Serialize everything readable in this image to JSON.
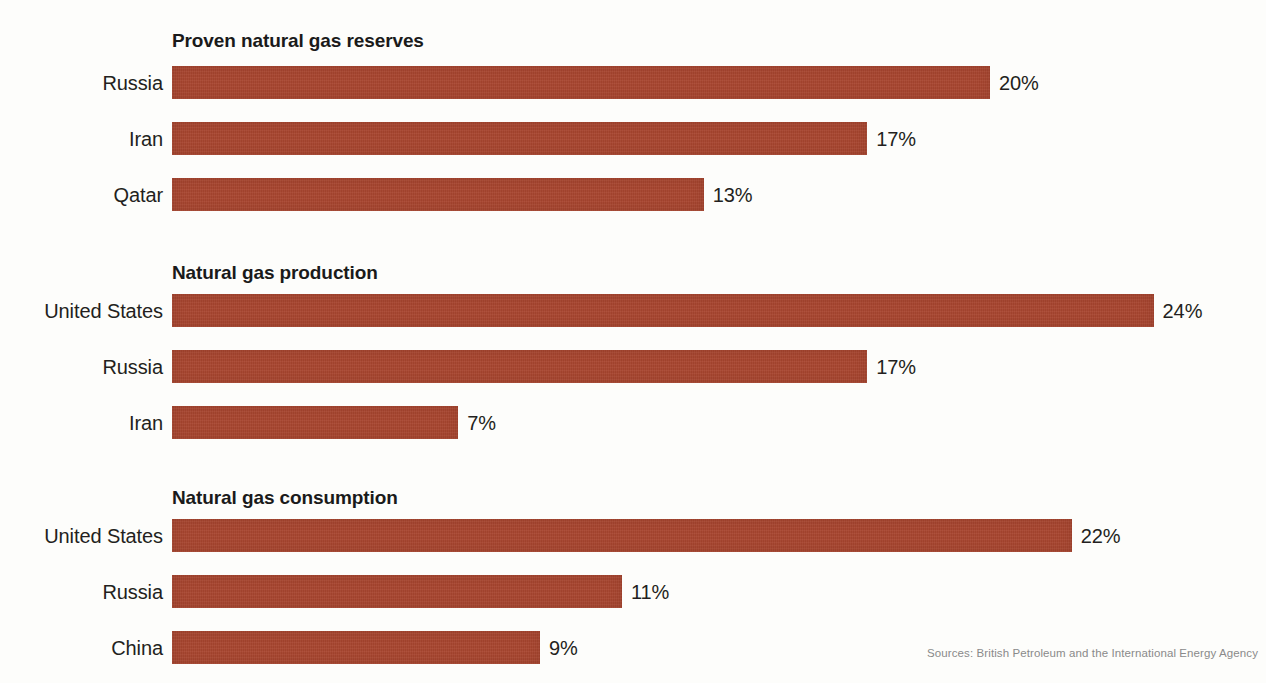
{
  "chart_data": {
    "type": "bar",
    "title": "",
    "orientation": "horizontal",
    "xlabel": "",
    "ylabel": "",
    "value_suffix": "%",
    "axis_max_percent": 26,
    "grid": false,
    "legend": false,
    "bar_color": "#a8452f",
    "panels": [
      {
        "title": "Proven natural gas reserves",
        "categories": [
          "Russia",
          "Iran",
          "Qatar"
        ],
        "values": [
          20,
          17,
          13
        ],
        "value_labels": [
          "20%",
          "17%",
          "13%"
        ]
      },
      {
        "title": "Natural gas production",
        "categories": [
          "United States",
          "Russia",
          "Iran"
        ],
        "values": [
          24,
          17,
          7
        ],
        "value_labels": [
          "24%",
          "17%",
          "7%"
        ]
      },
      {
        "title": "Natural gas consumption",
        "categories": [
          "United States",
          "Russia",
          "China"
        ],
        "values": [
          22,
          11,
          9
        ],
        "value_labels": [
          "22%",
          "11%",
          "9%"
        ]
      }
    ],
    "annotations": {
      "sources": "Sources: British Petroleum and the International Energy Agency"
    }
  }
}
